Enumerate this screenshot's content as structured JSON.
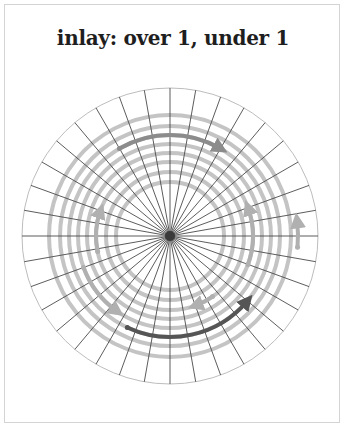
{
  "title": "inlay: over 1, under 1",
  "diagram": {
    "type": "basket-weave-base",
    "center": [
      170,
      236
    ],
    "outer_radius": 148,
    "spoke_count": 36,
    "ring_radii": [
      121,
      110,
      101,
      92,
      83,
      74,
      64,
      54
    ],
    "colors": {
      "outer_circle": "#bdbdbd",
      "spoke": "#4a4a4a",
      "ring": "#c4c4c4",
      "arrow_dark": "#555555",
      "arrow_mid": "#8c8c8c",
      "arrow_light": "#b0b0b0",
      "hub": "#3a3a3a"
    },
    "arrows": [
      {
        "name": "top-arc-arrow",
        "shade": "mid",
        "radius": 101,
        "start_deg": 240,
        "end_deg": 300
      },
      {
        "name": "left-vertical-arrow",
        "shade": "light",
        "radius": 74,
        "start_deg": 168,
        "end_deg": 200
      },
      {
        "name": "right-vertical-arrow",
        "shade": "light",
        "radius": 83,
        "start_deg": 20,
        "end_deg": -20
      },
      {
        "name": "right-outer-up-arrow",
        "shade": "light",
        "radius": 128,
        "start_deg": 5,
        "end_deg": -7
      },
      {
        "name": "bottom-arc-arrow",
        "shade": "dark",
        "radius": 101,
        "start_deg": 115,
        "end_deg": 40
      },
      {
        "name": "lower-left-arrow",
        "shade": "light",
        "radius": 92,
        "start_deg": 160,
        "end_deg": 125
      },
      {
        "name": "lower-right-inner-arrow",
        "shade": "light",
        "radius": 74,
        "start_deg": 55,
        "end_deg": 70
      }
    ]
  }
}
